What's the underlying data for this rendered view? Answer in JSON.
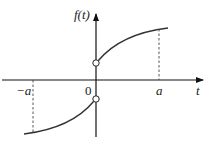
{
  "diagram": {
    "y_axis_label": "f(t)",
    "x_axis_label": "t",
    "tick_labels": {
      "neg_a": "−a",
      "zero": "0",
      "pos_a": "a"
    },
    "colors": {
      "axis": "#111111",
      "curve": "#333333",
      "dashed": "#444444",
      "background": "#ffffff"
    }
  }
}
